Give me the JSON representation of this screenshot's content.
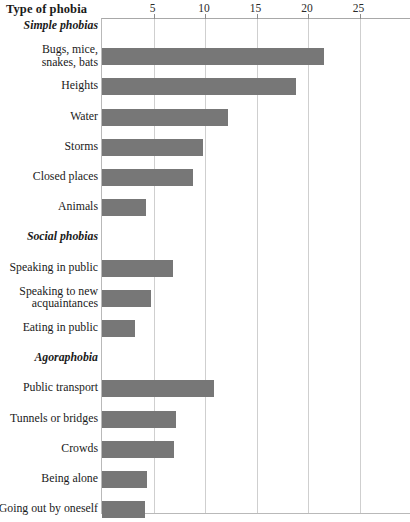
{
  "header": {
    "title": "Type of phobia"
  },
  "chart_data": {
    "type": "bar",
    "orientation": "horizontal",
    "title": "Type of phobia",
    "xlabel": "",
    "ylabel": "Type of phobia",
    "xlim": [
      0,
      30
    ],
    "xticks": [
      5,
      10,
      15,
      20,
      25
    ],
    "xtick_labels": [
      "5",
      "10",
      "15",
      "20",
      "25"
    ],
    "grid": true,
    "legend": "none",
    "bar_color": "#777777",
    "groups": [
      {
        "name": "Simple phobias",
        "categories": [
          "Bugs, mice, snakes, bats",
          "Heights",
          "Water",
          "Storms",
          "Closed places",
          "Animals"
        ],
        "values": [
          21.6,
          18.8,
          12.2,
          9.8,
          8.8,
          4.3
        ]
      },
      {
        "name": "Social phobias",
        "categories": [
          "Speaking in public",
          "Speaking to new acquaintances",
          "Eating in public"
        ],
        "values": [
          6.9,
          4.8,
          3.2
        ]
      },
      {
        "name": "Agoraphobia",
        "categories": [
          "Public transport",
          "Tunnels or bridges",
          "Crowds",
          "Being alone",
          "Going out by oneself"
        ],
        "values": [
          10.9,
          7.2,
          7.0,
          4.4,
          4.2
        ]
      }
    ],
    "categories": [
      "Bugs, mice, snakes, bats",
      "Heights",
      "Water",
      "Storms",
      "Closed places",
      "Animals",
      "Speaking in public",
      "Speaking to new acquaintances",
      "Eating in public",
      "Public transport",
      "Tunnels or bridges",
      "Crowds",
      "Being alone",
      "Going out by oneself"
    ],
    "values": [
      21.6,
      18.8,
      12.2,
      9.8,
      8.8,
      4.3,
      6.9,
      4.8,
      3.2,
      10.9,
      7.2,
      7.0,
      4.4,
      4.2
    ]
  },
  "rows": [
    {
      "kind": "section",
      "label": "Simple phobias"
    },
    {
      "kind": "bar",
      "label_line1": "Bugs, mice,",
      "label_line2": "snakes, bats",
      "value": 21.6
    },
    {
      "kind": "bar",
      "label_line1": "Heights",
      "value": 18.8
    },
    {
      "kind": "bar",
      "label_line1": "Water",
      "value": 12.2
    },
    {
      "kind": "bar",
      "label_line1": "Storms",
      "value": 9.8
    },
    {
      "kind": "bar",
      "label_line1": "Closed places",
      "value": 8.8
    },
    {
      "kind": "bar",
      "label_line1": "Animals",
      "value": 4.3
    },
    {
      "kind": "section",
      "label": "Social phobias"
    },
    {
      "kind": "bar",
      "label_line1": "Speaking in public",
      "value": 6.9
    },
    {
      "kind": "bar",
      "label_line1": "Speaking to new",
      "label_line2": "acquaintances",
      "value": 4.8
    },
    {
      "kind": "bar",
      "label_line1": "Eating in public",
      "value": 3.2
    },
    {
      "kind": "section",
      "label": "Agoraphobia"
    },
    {
      "kind": "bar",
      "label_line1": "Public transport",
      "value": 10.9
    },
    {
      "kind": "bar",
      "label_line1": "Tunnels or bridges",
      "value": 7.2
    },
    {
      "kind": "bar",
      "label_line1": "Crowds",
      "value": 7.0
    },
    {
      "kind": "bar",
      "label_line1": "Being alone",
      "value": 4.4
    },
    {
      "kind": "bar",
      "label_line1": "Going out by oneself",
      "value": 4.2
    }
  ],
  "geometry": {
    "x_origin_px": 101,
    "px_per_unit": 10.3,
    "plot_top_px": 18,
    "plot_bottom_px": 514,
    "row_pitch_px": 30.2,
    "first_row_center_px": 26,
    "bar_height_px": 17
  }
}
